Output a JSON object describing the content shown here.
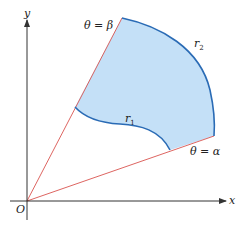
{
  "figure": {
    "type": "polar region between two curves",
    "colors": {
      "region_fill": "#c4e0f7",
      "curve_stroke": "#2a6bb5",
      "ray_stroke": "#d9534f",
      "axis_stroke": "#333333"
    },
    "axes": {
      "x_label": "x",
      "y_label": "y",
      "origin_label": "O"
    },
    "rays": {
      "beta": {
        "label": "θ = β"
      },
      "alpha": {
        "label": "θ = α"
      }
    },
    "curves": {
      "outer": {
        "label": "r",
        "subscript": "2"
      },
      "inner": {
        "label": "r",
        "subscript": "1"
      }
    }
  }
}
